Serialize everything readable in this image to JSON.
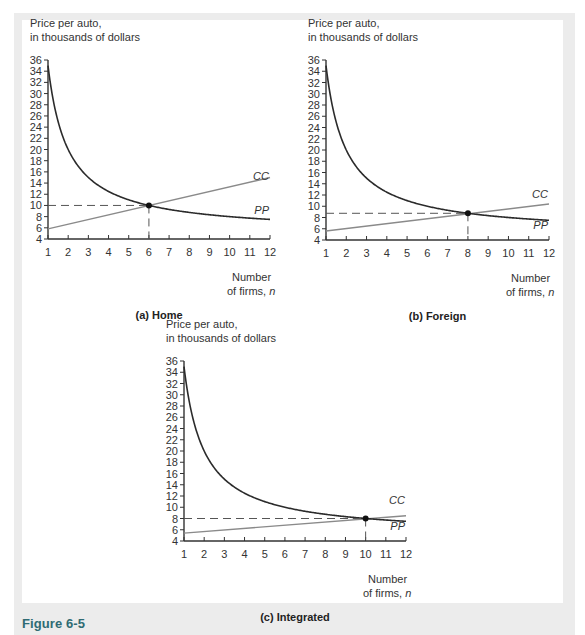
{
  "figure": {
    "label": "Figure 6-5",
    "accent_color": "#2f6b73"
  },
  "chart_data": [
    {
      "type": "line",
      "title": "(a) Home",
      "ylabel_line1": "Price per auto,",
      "ylabel_line2": "in thousands of dollars",
      "xlabel_line1": "Number",
      "xlabel_line2": "of firms, n",
      "xlim": [
        1,
        12
      ],
      "ylim": [
        4,
        36
      ],
      "x_ticks": [
        1,
        2,
        3,
        4,
        5,
        6,
        7,
        8,
        9,
        10,
        11,
        12
      ],
      "y_ticks": [
        4,
        6,
        8,
        10,
        12,
        14,
        16,
        18,
        20,
        22,
        24,
        26,
        28,
        30,
        32,
        34,
        36
      ],
      "grid": false,
      "series": [
        {
          "name": "PP",
          "x": [
            1,
            2,
            3,
            4,
            5,
            6,
            7,
            8,
            9,
            10,
            11,
            12
          ],
          "values": [
            35,
            20,
            15,
            12.5,
            11,
            10,
            9.29,
            8.75,
            8.33,
            8,
            7.73,
            7.5
          ]
        },
        {
          "name": "CC",
          "x": [
            1,
            12
          ],
          "values": [
            5.8,
            15
          ]
        }
      ],
      "equilibrium": {
        "n": 6,
        "price": 10
      }
    },
    {
      "type": "line",
      "title": "(b) Foreign",
      "ylabel_line1": "Price per auto,",
      "ylabel_line2": "in thousands of dollars",
      "xlabel_line1": "Number",
      "xlabel_line2": "of firms, n",
      "xlim": [
        1,
        12
      ],
      "ylim": [
        4,
        36
      ],
      "x_ticks": [
        1,
        2,
        3,
        4,
        5,
        6,
        7,
        8,
        9,
        10,
        11,
        12
      ],
      "y_ticks": [
        4,
        6,
        8,
        10,
        12,
        14,
        16,
        18,
        20,
        22,
        24,
        26,
        28,
        30,
        32,
        34,
        36
      ],
      "grid": false,
      "series": [
        {
          "name": "PP",
          "x": [
            1,
            2,
            3,
            4,
            5,
            6,
            7,
            8,
            9,
            10,
            11,
            12
          ],
          "values": [
            35,
            20,
            15,
            12.5,
            11,
            10,
            9.29,
            8.75,
            8.33,
            8,
            7.73,
            7.5
          ]
        },
        {
          "name": "CC",
          "x": [
            1,
            12
          ],
          "values": [
            5.6,
            10.4
          ]
        }
      ],
      "equilibrium": {
        "n": 8,
        "price": 8.75
      }
    },
    {
      "type": "line",
      "title": "(c) Integrated",
      "ylabel_line1": "Price per auto,",
      "ylabel_line2": "in thousands of dollars",
      "xlabel_line1": "Number",
      "xlabel_line2": "of firms, n",
      "xlim": [
        1,
        12
      ],
      "ylim": [
        4,
        36
      ],
      "x_ticks": [
        1,
        2,
        3,
        4,
        5,
        6,
        7,
        8,
        9,
        10,
        11,
        12
      ],
      "y_ticks": [
        4,
        6,
        8,
        10,
        12,
        14,
        16,
        18,
        20,
        22,
        24,
        26,
        28,
        30,
        32,
        34,
        36
      ],
      "grid": false,
      "series": [
        {
          "name": "PP",
          "x": [
            1,
            2,
            3,
            4,
            5,
            6,
            7,
            8,
            9,
            10,
            11,
            12
          ],
          "values": [
            35,
            20,
            15,
            12.5,
            11,
            10,
            9.29,
            8.75,
            8.33,
            8,
            7.73,
            7.5
          ]
        },
        {
          "name": "CC",
          "x": [
            1,
            12
          ],
          "values": [
            5.4,
            8.5
          ]
        }
      ],
      "equilibrium": {
        "n": 10,
        "price": 8
      }
    }
  ],
  "label_positions": [
    {
      "cc_y": 14.6,
      "pp_y": 8.4
    },
    {
      "cc_y": 11.4,
      "pp_y": 5.9
    },
    {
      "cc_y": 10.6,
      "pp_y": 6.0
    }
  ]
}
